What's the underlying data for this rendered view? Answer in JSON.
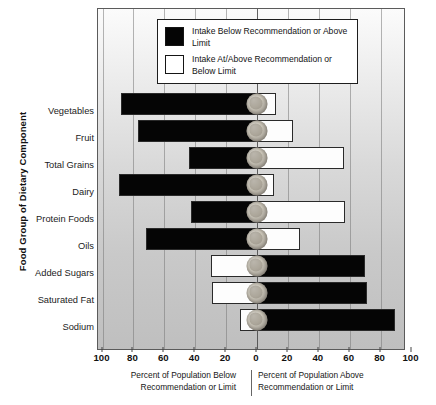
{
  "chart_data": {
    "type": "bar",
    "title": "",
    "subtitle": "",
    "orientation": "horizontal-diverging",
    "xlabel_left": "Percent of Population Below Recommendation or Limit",
    "xlabel_right": "Percent of Population Above Recommendation or Limit",
    "ylabel": "Food Group of Dietary Component",
    "xlim": [
      -100,
      100
    ],
    "xticks": [
      100,
      80,
      60,
      40,
      20,
      0,
      20,
      40,
      60,
      80,
      100
    ],
    "xtick_labels": [
      "100",
      "80",
      "60",
      "40",
      "20",
      "0",
      "20",
      "40",
      "60",
      "80",
      "100"
    ],
    "grid": true,
    "legend_position": "top-center",
    "categories": [
      "Vegetables",
      "Fruit",
      "Total Grains",
      "Dairy",
      "Protein Foods",
      "Oils",
      "Added Sugars",
      "Saturated Fat",
      "Sodium"
    ],
    "series": [
      {
        "name": "Intake Below Recommendation or Above Limit",
        "color": "#050505",
        "values": [
          88,
          77,
          44,
          89,
          43,
          72,
          70,
          71,
          89
        ]
      },
      {
        "name": "Intake At/Above Recommendation or Below Limit",
        "color": "#ffffff",
        "values": [
          12,
          23,
          56,
          11,
          57,
          28,
          30,
          29,
          11
        ]
      }
    ],
    "rows": [
      {
        "category": "Vegetables",
        "left_percent": 88,
        "right_percent": 12,
        "left_fill": "black",
        "right_fill": "white"
      },
      {
        "category": "Fruit",
        "left_percent": 77,
        "right_percent": 23,
        "left_fill": "black",
        "right_fill": "white"
      },
      {
        "category": "Total Grains",
        "left_percent": 44,
        "right_percent": 56,
        "left_fill": "black",
        "right_fill": "white"
      },
      {
        "category": "Dairy",
        "left_percent": 89,
        "right_percent": 11,
        "left_fill": "black",
        "right_fill": "white"
      },
      {
        "category": "Protein Foods",
        "left_percent": 43,
        "right_percent": 57,
        "left_fill": "black",
        "right_fill": "white"
      },
      {
        "category": "Oils",
        "left_percent": 72,
        "right_percent": 28,
        "left_fill": "black",
        "right_fill": "white"
      },
      {
        "category": "Added Sugars",
        "left_percent": 30,
        "right_percent": 70,
        "left_fill": "white",
        "right_fill": "black"
      },
      {
        "category": "Saturated Fat",
        "left_percent": 29,
        "right_percent": 71,
        "left_fill": "white",
        "right_fill": "black"
      },
      {
        "category": "Sodium",
        "left_percent": 11,
        "right_percent": 89,
        "left_fill": "white",
        "right_fill": "black"
      }
    ]
  },
  "legend": {
    "items": [
      {
        "swatch": "black",
        "label": "Intake Below Recommendation or Above Limit"
      },
      {
        "swatch": "white",
        "label": "Intake At/Above Recommendation or Below Limit"
      }
    ]
  },
  "axis": {
    "y_title": "Food Group of Dietary Component",
    "caption_left": "Percent of Population Below Recommendation or Limit",
    "caption_right": "Percent of Population Above Recommendation or Limit"
  }
}
